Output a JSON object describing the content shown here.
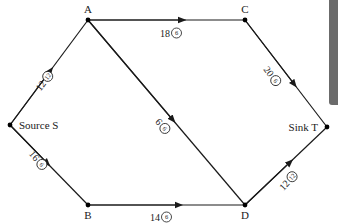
{
  "diagram": {
    "type": "flow-network",
    "nodes": [
      {
        "id": "S",
        "label": "Source S",
        "x": 10,
        "y": 125,
        "label_x": 19,
        "label_y": 129,
        "anchor": "start"
      },
      {
        "id": "A",
        "label": "A",
        "x": 88,
        "y": 20,
        "label_x": 88,
        "label_y": 13,
        "anchor": "middle"
      },
      {
        "id": "C",
        "label": "C",
        "x": 245,
        "y": 20,
        "label_x": 245,
        "label_y": 13,
        "anchor": "middle"
      },
      {
        "id": "B",
        "label": "B",
        "x": 88,
        "y": 205,
        "label_x": 88,
        "label_y": 219,
        "anchor": "middle"
      },
      {
        "id": "D",
        "label": "D",
        "x": 245,
        "y": 205,
        "label_x": 245,
        "label_y": 219,
        "anchor": "middle"
      },
      {
        "id": "T",
        "label": "Sink T",
        "x": 327,
        "y": 127,
        "label_x": 318,
        "label_y": 131,
        "anchor": "end"
      }
    ],
    "edges": [
      {
        "from": "S",
        "to": "A",
        "capacity": "12",
        "flow": "12",
        "arrow_t": 0.52,
        "label_x": 45,
        "label_y": 80,
        "angle": -53
      },
      {
        "from": "A",
        "to": "C",
        "capacity": "18",
        "flow": "6",
        "arrow_t": 0.6,
        "label_x": 172,
        "label_y": 33,
        "angle": 0
      },
      {
        "from": "C",
        "to": "T",
        "capacity": "20",
        "flow": "6",
        "arrow_t": 0.6,
        "label_x": 273,
        "label_y": 77,
        "angle": 53
      },
      {
        "from": "A",
        "to": "D",
        "capacity": "6",
        "flow": "6",
        "arrow_t": 0.54,
        "label_x": 162,
        "label_y": 125,
        "angle": 50
      },
      {
        "from": "S",
        "to": "B",
        "capacity": "16",
        "flow": "6",
        "arrow_t": 0.48,
        "label_x": 39,
        "label_y": 161,
        "angle": 50
      },
      {
        "from": "B",
        "to": "D",
        "capacity": "14",
        "flow": "6",
        "arrow_t": 0.58,
        "label_x": 162,
        "label_y": 217,
        "angle": 0
      },
      {
        "from": "D",
        "to": "T",
        "capacity": "12",
        "flow": "12",
        "arrow_t": 0.55,
        "label_x": 289,
        "label_y": 180,
        "angle": -47
      }
    ]
  },
  "colors": {
    "line": "#1a1a1a",
    "background": "#ffffff",
    "side_bar": "#6b6b6b"
  }
}
